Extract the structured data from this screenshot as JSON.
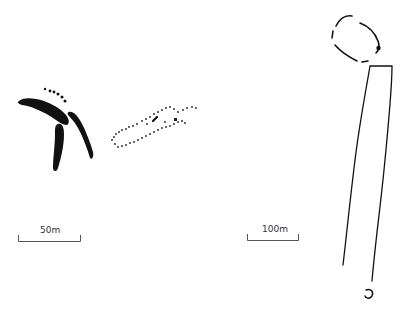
{
  "figure": {
    "type": "site-plan",
    "background": "#ffffff",
    "ink_color": "#111111"
  },
  "plans": [
    {
      "id": "left-plan",
      "features": [
        "curving ditch segments (solid)",
        "dotted ditch line (arc)",
        "dotted oval enclosure"
      ],
      "scale_bar": {
        "label": "50m"
      }
    },
    {
      "id": "right-plan",
      "features": [
        "broken-line rounded enclosure",
        "long narrow rectangular enclosure (cursus-like)",
        "small ring feature"
      ],
      "scale_bar": {
        "label": "100m"
      }
    }
  ]
}
